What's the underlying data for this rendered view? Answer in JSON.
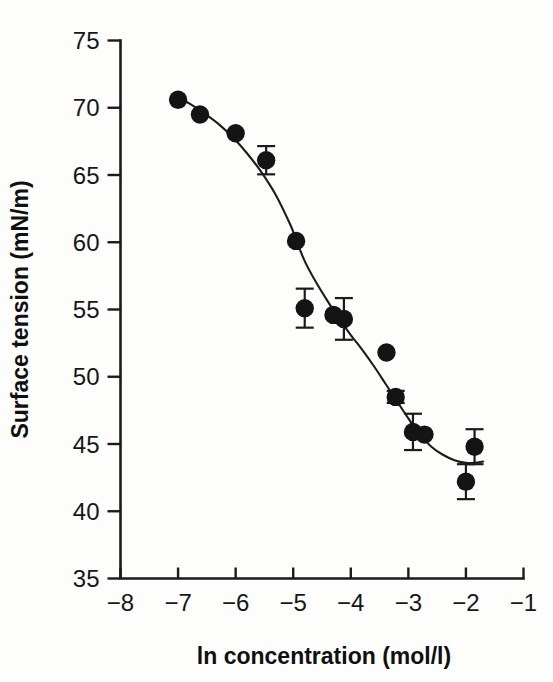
{
  "chart_data": {
    "type": "scatter",
    "title": "",
    "xlabel": "ln concentration (mol/l)",
    "ylabel": "Surface tension (mN/m)",
    "xlim": [
      -8,
      -1
    ],
    "ylim": [
      35,
      75
    ],
    "xticks": [
      -8,
      -7,
      -6,
      -5,
      -4,
      -3,
      -2,
      -1
    ],
    "xtick_labels": [
      "−8",
      "−7",
      "−6",
      "−5",
      "−4",
      "−3",
      "−2",
      "−1"
    ],
    "yticks": [
      35,
      40,
      45,
      50,
      55,
      60,
      65,
      70,
      75
    ],
    "ytick_labels": [
      "35",
      "40",
      "45",
      "50",
      "55",
      "60",
      "65",
      "70",
      "75"
    ],
    "grid": false,
    "legend": "none",
    "marker_style": "filled-circle",
    "marker_color": "#141414",
    "curve_color": "#1c1c1c",
    "axis_color": "#1b1b1b",
    "series": [
      {
        "name": "Surface tension",
        "x": [
          -7.0,
          -6.62,
          -6.0,
          -5.47,
          -4.95,
          -4.8,
          -4.3,
          -4.12,
          -3.38,
          -3.22,
          -2.92,
          -2.72,
          -2.0,
          -1.85
        ],
        "y": [
          70.6,
          69.5,
          68.1,
          66.1,
          60.1,
          55.1,
          54.6,
          54.3,
          51.8,
          48.5,
          45.9,
          45.7,
          42.2,
          44.8
        ],
        "yerr": [
          0.0,
          0.0,
          0.0,
          1.05,
          0.0,
          1.45,
          0.0,
          1.55,
          0.0,
          0.45,
          1.35,
          0.0,
          1.3,
          1.3
        ]
      }
    ],
    "fit_curve": {
      "name": "sigmoidal fit",
      "x": [
        -7.05,
        -6.8,
        -6.55,
        -6.3,
        -6.05,
        -5.8,
        -5.55,
        -5.3,
        -5.05,
        -4.95,
        -4.8,
        -4.6,
        -4.4,
        -4.2,
        -4.0,
        -3.8,
        -3.6,
        -3.4,
        -3.2,
        -3.0,
        -2.8,
        -2.6,
        -2.4,
        -2.2,
        -2.0,
        -1.85,
        -1.7
      ],
      "y": [
        70.9,
        70.3,
        69.6,
        68.8,
        67.8,
        66.6,
        65.2,
        63.5,
        61.3,
        60.2,
        58.6,
        57.0,
        55.6,
        54.3,
        53.1,
        52.0,
        50.8,
        49.5,
        48.2,
        46.9,
        45.7,
        44.8,
        44.2,
        43.8,
        43.6,
        43.6,
        43.7
      ]
    }
  },
  "axes": {
    "x_label": "ln concentration (mol/l)",
    "y_label": "Surface tension (mN/m)"
  }
}
